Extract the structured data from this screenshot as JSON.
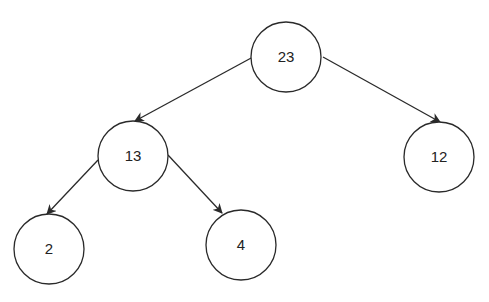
{
  "diagram": {
    "type": "binary-tree",
    "colors": {
      "stroke": "#2a2a2a",
      "fill": "#ffffff",
      "text": "#222222"
    },
    "nodes": [
      {
        "id": "n23",
        "label": "23",
        "cx": 286,
        "cy": 57,
        "r": 35
      },
      {
        "id": "n13",
        "label": "13",
        "cx": 133,
        "cy": 156,
        "r": 35
      },
      {
        "id": "n12",
        "label": "12",
        "cx": 439,
        "cy": 157,
        "r": 35
      },
      {
        "id": "n2",
        "label": "2",
        "cx": 49,
        "cy": 249,
        "r": 35
      },
      {
        "id": "n4",
        "label": "4",
        "cx": 241,
        "cy": 245,
        "r": 35
      }
    ],
    "edges": [
      {
        "from": "23",
        "to": "13",
        "x1": 253,
        "y1": 57,
        "x2": 135,
        "y2": 121
      },
      {
        "from": "23",
        "to": "12",
        "x1": 323,
        "y1": 57,
        "x2": 440,
        "y2": 122
      },
      {
        "from": "13",
        "to": "2",
        "x1": 98,
        "y1": 160,
        "x2": 47,
        "y2": 214
      },
      {
        "from": "13",
        "to": "4",
        "x1": 168,
        "y1": 155,
        "x2": 222,
        "y2": 213
      }
    ]
  }
}
